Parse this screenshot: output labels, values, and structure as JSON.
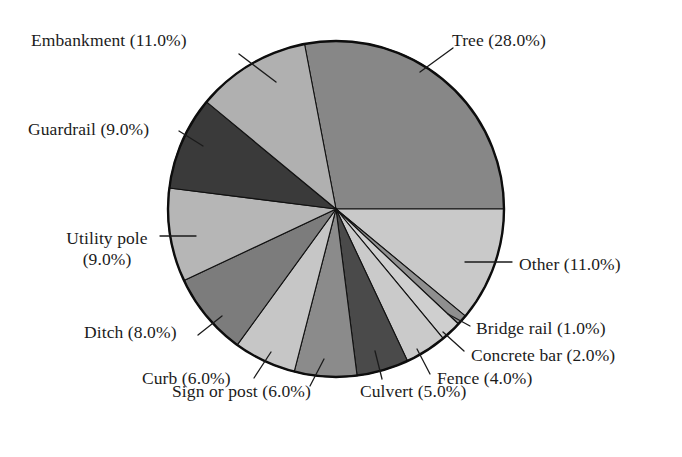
{
  "chart_data": {
    "type": "pie",
    "title": "",
    "subtitle": "",
    "xlabel": "",
    "ylabel": "",
    "legend_position": "none",
    "labels_format": "name (value%)",
    "start_angle_deg_from_12oclock": -10.8,
    "direction": "clockwise",
    "units": "percent",
    "total": 100.0,
    "categories": [
      "Tree",
      "Other",
      "Bridge rail",
      "Concrete bar",
      "Fence",
      "Culvert",
      "Sign or post",
      "Curb",
      "Ditch",
      "Utility pole",
      "Guardrail",
      "Embankment"
    ],
    "values": [
      28.0,
      11.0,
      1.0,
      2.0,
      4.0,
      5.0,
      6.0,
      6.0,
      8.0,
      9.0,
      9.0,
      11.0
    ],
    "slices": [
      {
        "name": "Tree",
        "value": 28.0,
        "label": "Tree (28.0%)",
        "color": "#878787"
      },
      {
        "name": "Other",
        "value": 11.0,
        "label": "Other (11.0%)",
        "color": "#c9c9c9"
      },
      {
        "name": "Bridge rail",
        "value": 1.0,
        "label": "Bridge rail (1.0%)",
        "color": "#8f8f8f"
      },
      {
        "name": "Concrete bar",
        "value": 2.0,
        "label": "Concrete bar (2.0%)",
        "color": "#cfcfcf"
      },
      {
        "name": "Fence",
        "value": 4.0,
        "label": "Fence (4.0%)",
        "color": "#cacaca"
      },
      {
        "name": "Culvert",
        "value": 5.0,
        "label": "Culvert (5.0%)",
        "color": "#4a4a4a"
      },
      {
        "name": "Sign or post",
        "value": 6.0,
        "label": "Sign or post (6.0%)",
        "color": "#8b8b8b"
      },
      {
        "name": "Curb",
        "value": 6.0,
        "label": "Curb (6.0%)",
        "color": "#c6c6c6"
      },
      {
        "name": "Ditch",
        "value": 8.0,
        "label": "Ditch (8.0%)",
        "color": "#7c7c7c"
      },
      {
        "name": "Utility pole",
        "value": 9.0,
        "label": "Utility pole\n(9.0%)",
        "color": "#b6b6b6"
      },
      {
        "name": "Guardrail",
        "value": 9.0,
        "label": "Guardrail (9.0%)",
        "color": "#3a3a3a"
      },
      {
        "name": "Embankment",
        "value": 11.0,
        "label": "Embankment (11.0%)",
        "color": "#b0b0b0"
      }
    ]
  },
  "labels": {
    "embankment": "Embankment (11.0%)",
    "guardrail": "Guardrail (9.0%)",
    "utility_pole_line1": "Utility pole",
    "utility_pole_line2": "(9.0%)",
    "ditch": "Ditch (8.0%)",
    "curb": "Curb (6.0%)",
    "sign_or_post": "Sign or post (6.0%)",
    "culvert": "Culvert (5.0%)",
    "fence": "Fence (4.0%)",
    "concrete_bar": "Concrete bar (2.0%)",
    "bridge_rail": "Bridge rail (1.0%)",
    "tree": "Tree (28.0%)",
    "other": "Other (11.0%)"
  },
  "geometry": {
    "center_x": 336,
    "center_y": 209,
    "radius": 168
  },
  "colors": {
    "background": "#ffffff",
    "outline": "#0d0d0d",
    "text": "#1b1b1b"
  }
}
